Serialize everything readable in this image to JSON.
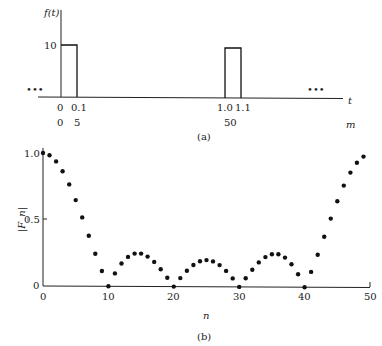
{
  "figure": {
    "panel_a": {
      "caption": "(a)",
      "ylabel": "f(t)",
      "ytick": "10",
      "xlabel_t": "t",
      "xlabel_m": "m",
      "ellipsis_left": "•••",
      "ellipsis_right": "•••",
      "t_ticks": [
        "0",
        "0.1",
        "1.0",
        "1.1"
      ],
      "m_ticks": [
        "0",
        "5",
        "50"
      ]
    },
    "panel_b": {
      "caption": "(b)",
      "ylabel": "|F_n|",
      "xlabel": "n",
      "yticks": [
        "0",
        "0.5",
        "1.0"
      ],
      "xticks": [
        "0",
        "10",
        "20",
        "30",
        "40",
        "50"
      ]
    }
  },
  "chart_data": [
    {
      "type": "line",
      "title": "(a) Periodic rectangular pulse f(t)",
      "xlabel": "t",
      "ylabel": "f(t)",
      "secondary_xlabel": "m",
      "x": [
        0,
        0,
        0.1,
        0.1,
        1.0,
        1.0,
        1.1,
        1.1,
        1.6
      ],
      "values": [
        10,
        10,
        10,
        0,
        0,
        10,
        10,
        0,
        0
      ],
      "t_tick_labels": [
        "0",
        "0.1",
        "1.0",
        "1.1"
      ],
      "m_tick_labels": [
        "0",
        "5",
        "50"
      ],
      "y_tick_labels": [
        "10"
      ],
      "annotations": [
        "•••",
        "•••"
      ],
      "grid": false
    },
    {
      "type": "scatter",
      "title": "(b) Magnitude of DFT coefficients",
      "xlabel": "n",
      "ylabel": "|F_n|",
      "xlim": [
        0,
        50
      ],
      "ylim": [
        0,
        1.0
      ],
      "x_tick_labels": [
        "0",
        "10",
        "20",
        "30",
        "40",
        "50"
      ],
      "y_tick_labels": [
        "0",
        "0.5",
        "1.0"
      ],
      "grid": false,
      "x": [
        0,
        1,
        2,
        3,
        4,
        5,
        6,
        7,
        8,
        9,
        10,
        11,
        12,
        13,
        14,
        15,
        16,
        17,
        18,
        19,
        20,
        21,
        22,
        23,
        24,
        25,
        26,
        27,
        28,
        29,
        30,
        31,
        32,
        33,
        34,
        35,
        36,
        37,
        38,
        39,
        40,
        41,
        42,
        43,
        44,
        45,
        46,
        47,
        48,
        49
      ],
      "values": [
        1.0,
        0.984,
        0.937,
        0.863,
        0.765,
        0.647,
        0.517,
        0.38,
        0.244,
        0.115,
        0.0,
        0.097,
        0.172,
        0.222,
        0.247,
        0.247,
        0.225,
        0.185,
        0.13,
        0.066,
        0.0,
        0.064,
        0.12,
        0.163,
        0.191,
        0.2,
        0.191,
        0.163,
        0.12,
        0.064,
        0.0,
        0.066,
        0.13,
        0.185,
        0.225,
        0.247,
        0.247,
        0.222,
        0.172,
        0.097,
        0.0,
        0.115,
        0.244,
        0.38,
        0.517,
        0.647,
        0.765,
        0.863,
        0.937,
        0.984
      ]
    }
  ]
}
